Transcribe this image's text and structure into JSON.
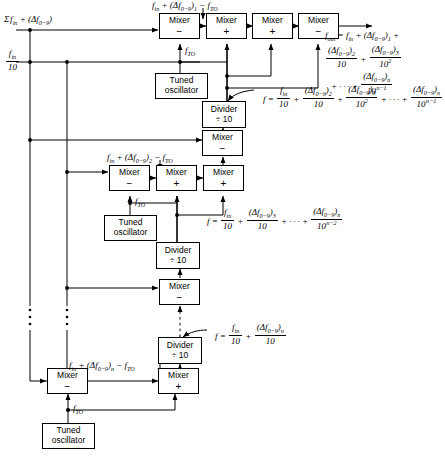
{
  "diagram": {
    "stroke_color": "#000000",
    "background_color": "#ffffff",
    "inputs": [
      {
        "id": "sum-input",
        "label": "Σ f_in + (Δf_0-9)",
        "position": "top-left"
      },
      {
        "id": "fin-over-10-input",
        "label": "f_in / 10",
        "position": "left"
      }
    ],
    "blocks": [
      {
        "id": "mixer-r1-c1",
        "type": "Mixer",
        "sign": "−",
        "row": 1
      },
      {
        "id": "mixer-r1-c2",
        "type": "Mixer",
        "sign": "+",
        "row": 1
      },
      {
        "id": "mixer-r1-c3",
        "type": "Mixer",
        "sign": "+",
        "row": 1
      },
      {
        "id": "mixer-r1-c4",
        "type": "Mixer",
        "sign": "−",
        "row": 1
      },
      {
        "id": "tuned-oscillator-1",
        "type": "Tuned oscillator",
        "row": 1
      },
      {
        "id": "divider-1",
        "type": "Divider",
        "divisor": "÷ 10",
        "row": 1
      },
      {
        "id": "mixer-r2-top",
        "type": "Mixer",
        "sign": "−",
        "row": 2
      },
      {
        "id": "mixer-r2-c1",
        "type": "Mixer",
        "sign": "−",
        "row": 2
      },
      {
        "id": "mixer-r2-c2",
        "type": "Mixer",
        "sign": "+",
        "row": 2
      },
      {
        "id": "mixer-r2-c3",
        "type": "Mixer",
        "sign": "+",
        "row": 2
      },
      {
        "id": "tuned-oscillator-2",
        "type": "Tuned oscillator",
        "row": 2
      },
      {
        "id": "divider-2",
        "type": "Divider",
        "divisor": "÷ 10",
        "row": 2
      },
      {
        "id": "mixer-r3-mid",
        "type": "Mixer",
        "sign": "−",
        "row": 3
      },
      {
        "id": "divider-3",
        "type": "Divider",
        "divisor": "÷ 10",
        "row": 3
      },
      {
        "id": "mixer-rn-c1",
        "type": "Mixer",
        "sign": "−",
        "row": "n"
      },
      {
        "id": "mixer-rn-c2",
        "type": "Mixer",
        "sign": "+",
        "row": "n"
      },
      {
        "id": "tuned-oscillator-3",
        "type": "Tuned oscillator",
        "row": "n"
      }
    ],
    "box_labels": {
      "mixer": "Mixer",
      "divider_name": "Divider",
      "divider_divisor": "÷ 10",
      "tuned_line1": "Tuned",
      "tuned_line2": "oscillator",
      "sign_minus": "−",
      "sign_plus": "+"
    },
    "signal_labels": {
      "stage1_inter": "f_in + (Δf_0-9)_1 − f_TO",
      "stage2_inter": "f_in + (Δf_0-9)_2 − f_TO",
      "stagen_inter": "f_in + (Δf_0-9)_n − f_TO",
      "fto": "f_TO"
    },
    "equations": {
      "fout": "f_out = f_in + (Δf_0-9)_1 + (Δf_0-9)_2/10 + (Δf_0-9)_3/10^2 + ··· + (Δf_0-9)_n/10^(n−1)",
      "divider1": "f = f_in/10 + (Δf_0-9)_2/10 + (Δf_0-9)_3/10^2 + ··· + (Δf_0-9)_n/10^(n−1)",
      "divider2": "f = f_in/10 + (Δf_0-9)_3/10 + ··· + (Δf_0-9)_n/10^(n−2)",
      "divider3": "f = f_in/10 + (Δf_0-9)_n/10"
    },
    "ellipsis_marks": [
      "left-rail-1",
      "left-rail-2",
      "center-column"
    ]
  }
}
